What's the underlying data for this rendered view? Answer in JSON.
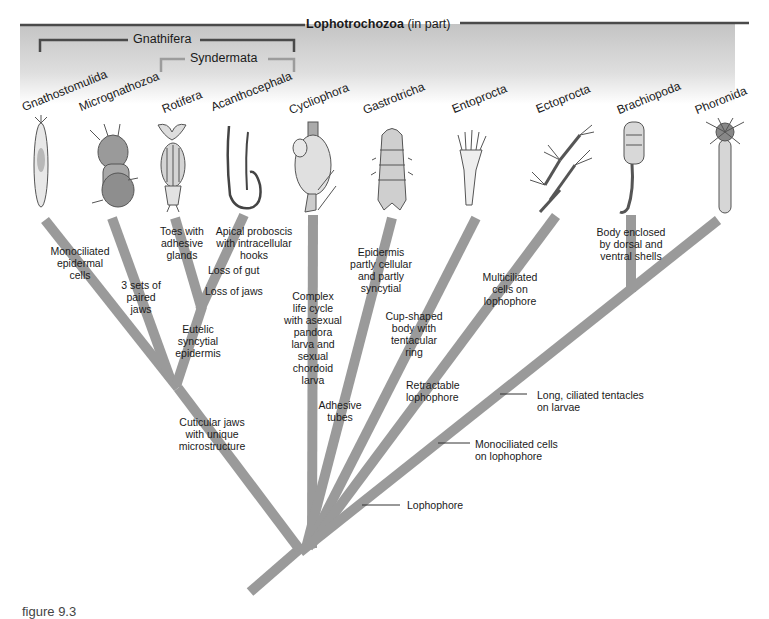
{
  "header": {
    "title_bold": "Lophotrochozoa",
    "title_rest": " (in part)",
    "gnathifera": "Gnathifera",
    "syndermata": "Syndermata"
  },
  "taxa": [
    {
      "name": "Gnathostomulida"
    },
    {
      "name": "Micrognathozoa"
    },
    {
      "name": "Rotifera"
    },
    {
      "name": "Acanthocephala"
    },
    {
      "name": "Cycliophora"
    },
    {
      "name": "Gastrotricha"
    },
    {
      "name": "Entoprocta"
    },
    {
      "name": "Ectoprocta"
    },
    {
      "name": "Brachiopoda"
    },
    {
      "name": "Phoronida"
    }
  ],
  "characters": {
    "gnathostomulida": [
      "Monociliated",
      "epidermal",
      "cells"
    ],
    "micrognathozoa": [
      "3 sets of",
      "paired",
      "jaws"
    ],
    "rotifera": [
      "Toes with",
      "adhesive",
      "glands"
    ],
    "acanthocephala": [
      "Apical proboscis",
      "with intracellular",
      "hooks"
    ],
    "loss_gut": "Loss of gut",
    "loss_jaws": "Loss of jaws",
    "syndermata": [
      "Eutelic",
      "syncytial",
      "epidermis"
    ],
    "gnathifera": [
      "Cuticular jaws",
      "with unique",
      "microstructure"
    ],
    "cycliophora": [
      "Complex",
      "life cycle",
      "with asexual",
      "pandora",
      "larva and",
      "sexual",
      "chordoid",
      "larva"
    ],
    "adhesive_tubes": [
      "Adhesive",
      "tubes"
    ],
    "gastrotricha": [
      "Epidermis",
      "partly cellular",
      "and partly",
      "syncytial"
    ],
    "entoprocta": [
      "Cup-shaped",
      "body with",
      "tentacular",
      "ring"
    ],
    "retractable": [
      "Retractable",
      "lophophore"
    ],
    "ectoprocta": [
      "Multiciliated",
      "cells on",
      "lophophore"
    ],
    "brachiopoda": [
      "Body enclosed",
      "by dorsal and",
      "ventral shells"
    ],
    "long_ciliated": [
      "Long, ciliated tentacles",
      "on larvae"
    ],
    "monociliated_lophophore": [
      "Monociliated cells",
      "on lophophore"
    ],
    "lophophore": "Lophophore"
  },
  "caption": "figure 9.3",
  "colors": {
    "branch": "#9a9a9a",
    "bracket_dark": "#4a4a4a",
    "bracket_light": "#9c9c9c",
    "header_band": "#c4c4c4"
  }
}
